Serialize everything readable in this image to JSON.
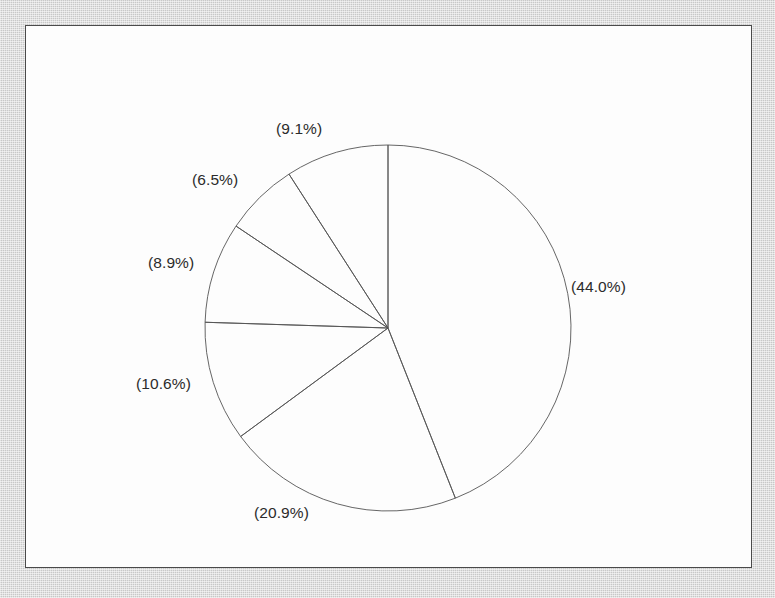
{
  "document": {
    "background_color": "#c8c8c8",
    "paper_color": "#fdfdfd",
    "border_color": "#4a4a4a"
  },
  "chart_data": {
    "type": "pie",
    "title": "",
    "subtitle": "",
    "xlabel": "",
    "ylabel": "",
    "grid": false,
    "legend_position": "none",
    "filled": false,
    "outline_color": "#555555",
    "start_angle_deg": 90,
    "direction": "clockwise",
    "label_format": "(p%)",
    "categories": [
      "Slice 1",
      "Slice 2",
      "Slice 3",
      "Slice 4",
      "Slice 5",
      "Slice 6"
    ],
    "values": [
      44.0,
      20.9,
      10.6,
      8.9,
      6.5,
      9.1
    ],
    "labels": [
      "(44.0%)",
      "(20.9%)",
      "(10.6%)",
      "(8.9%)",
      "(6.5%)",
      "(9.1%)"
    ],
    "slices": [
      {
        "label": "(44.0%)",
        "value": 44.0,
        "start_deg": 0.0,
        "sweep_deg": 158.4,
        "label_x": 545,
        "label_y": 252,
        "label_anchor": "start"
      },
      {
        "label": "(20.9%)",
        "value": 20.9,
        "start_deg": 158.4,
        "sweep_deg": 75.24,
        "label_x": 228,
        "label_y": 478,
        "label_anchor": "start"
      },
      {
        "label": "(10.6%)",
        "value": 10.6,
        "start_deg": 233.64,
        "sweep_deg": 38.16,
        "label_x": 110,
        "label_y": 349,
        "label_anchor": "start"
      },
      {
        "label": "(8.9%)",
        "value": 8.9,
        "start_deg": 271.8,
        "sweep_deg": 32.04,
        "label_x": 122,
        "label_y": 228,
        "label_anchor": "start"
      },
      {
        "label": "(6.5%)",
        "value": 6.5,
        "start_deg": 303.84,
        "sweep_deg": 23.4,
        "label_x": 166,
        "label_y": 145,
        "label_anchor": "start"
      },
      {
        "label": "(9.1%)",
        "value": 9.1,
        "start_deg": 327.24,
        "sweep_deg": 32.76,
        "label_x": 250,
        "label_y": 94,
        "label_anchor": "start"
      }
    ],
    "geometry": {
      "center_x": 362,
      "center_y": 302,
      "radius": 183
    }
  }
}
